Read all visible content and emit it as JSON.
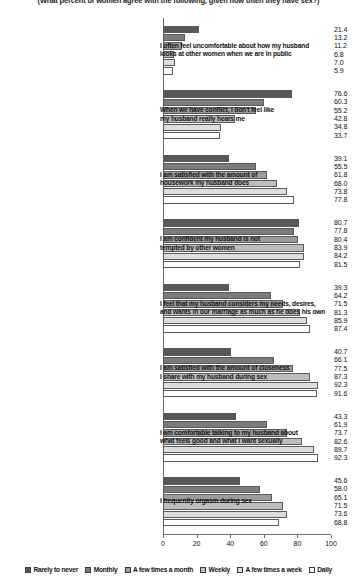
{
  "chart_data": {
    "type": "bar",
    "orientation": "horizontal",
    "title": "(What percent of women agree with the following, given how often they have sex?)",
    "xlabel": "",
    "ylabel": "",
    "xlim": [
      0,
      100
    ],
    "xticks": [
      "0",
      "20",
      "40",
      "60",
      "80",
      "100"
    ],
    "grid": false,
    "legend_position": "bottom",
    "categories": [
      "I often feel uncomfortable about how my husband looks at other women when we are in public",
      "When we have conflict, I don't feel like my husband really hears me",
      "I am satisfied with the amount of housework my husband does",
      "I am confident my husband is not tempted by other women",
      "I feel that my husband considers my needs, desires, and wants in our marriage as much as he does his own",
      "I am satisfied with the amount of closeness I share with my husband during sex",
      "I am comfortable talking to my husband about what feels good and what I want sexually",
      "I frequently orgasm during sex"
    ],
    "category_lines": [
      [
        "I often feel uncomfortable about how my husband",
        "looks at other women when we are in public"
      ],
      [
        "When we have conflict, I don't feel like",
        "my husband really hears me"
      ],
      [
        "I am satisfied with the amount of",
        "housework my husband does"
      ],
      [
        "I am confident my husband is not",
        "tempted by other women"
      ],
      [
        "I feel that my husband considers my needs, desires,",
        "and wants in our marriage as much as he does his own"
      ],
      [
        "I am satisfied with the amount of closeness",
        "I share with my husband during sex"
      ],
      [
        "I am comfortable talking to my husband about",
        "what feels good and what I want sexually"
      ],
      [
        "I frequently orgasm during sex"
      ]
    ],
    "series": [
      {
        "name": "Rarely to never",
        "color": "#58585a",
        "values": [
          21.4,
          76.6,
          39.1,
          80.7,
          39.3,
          40.7,
          43.3,
          45.6
        ]
      },
      {
        "name": "Monthly",
        "color": "#7b7b7d",
        "values": [
          13.2,
          60.3,
          55.5,
          77.8,
          64.2,
          66.1,
          61.9,
          58.0
        ]
      },
      {
        "name": "A few times a month",
        "color": "#9d9d9f",
        "values": [
          11.2,
          55.2,
          61.8,
          80.4,
          71.5,
          77.5,
          73.7,
          65.1
        ]
      },
      {
        "name": "Weekly",
        "color": "#bdbdbf",
        "values": [
          6.8,
          42.8,
          68.0,
          83.9,
          81.3,
          87.3,
          82.6,
          71.5
        ]
      },
      {
        "name": "A few times a week",
        "color": "#dddddf",
        "values": [
          7.0,
          34.8,
          73.8,
          84.2,
          85.9,
          92.3,
          89.7,
          73.6
        ]
      },
      {
        "name": "Daily",
        "color": "#ffffff",
        "values": [
          5.9,
          33.7,
          77.8,
          81.5,
          87.4,
          91.6,
          92.3,
          68.8
        ]
      }
    ]
  }
}
